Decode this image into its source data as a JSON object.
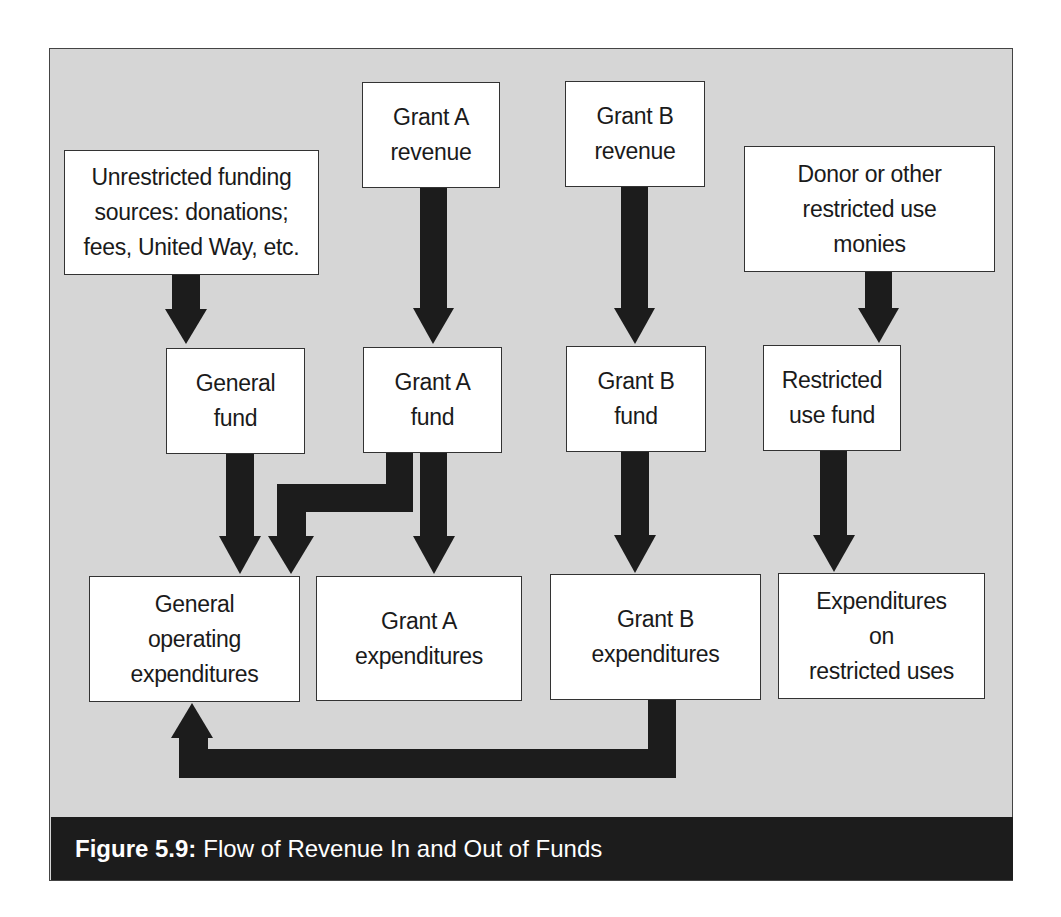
{
  "figure": {
    "caption_label": "Figure 5.9:",
    "caption_title": "Flow of Revenue In and Out of Funds",
    "colors": {
      "panel_bg": "#d6d6d6",
      "box_bg": "#ffffff",
      "arrow": "#1c1c1c",
      "caption_bg": "#1c1c1c",
      "caption_text": "#ffffff"
    }
  },
  "nodes": {
    "unrestricted_sources": "Unrestricted funding\nsources: donations;\nfees, United Way, etc.",
    "grant_a_revenue": "Grant A\nrevenue",
    "grant_b_revenue": "Grant B\nrevenue",
    "donor_restricted": "Donor or other\nrestricted use\nmonies",
    "general_fund": "General\nfund",
    "grant_a_fund": "Grant A\nfund",
    "grant_b_fund": "Grant B\nfund",
    "restricted_use_fund": "Restricted\nuse fund",
    "general_operating_expenditures": "General\noperating\nexpenditures",
    "grant_a_expenditures": "Grant A\nexpenditures",
    "grant_b_expenditures": "Grant B\nexpenditures",
    "restricted_expenditures": "Expenditures\non\nrestricted uses"
  },
  "edges": [
    {
      "from": "Unrestricted funding sources",
      "to": "General fund"
    },
    {
      "from": "Grant A revenue",
      "to": "Grant A fund"
    },
    {
      "from": "Grant B revenue",
      "to": "Grant B fund"
    },
    {
      "from": "Donor or other restricted use monies",
      "to": "Restricted use fund"
    },
    {
      "from": "General fund",
      "to": "General operating expenditures"
    },
    {
      "from": "Grant A fund",
      "to": "General operating expenditures"
    },
    {
      "from": "Grant A fund",
      "to": "Grant A expenditures"
    },
    {
      "from": "Grant B fund",
      "to": "Grant B expenditures"
    },
    {
      "from": "Restricted use fund",
      "to": "Expenditures on restricted uses"
    },
    {
      "from": "Grant B expenditures",
      "to": "General operating expenditures"
    }
  ]
}
